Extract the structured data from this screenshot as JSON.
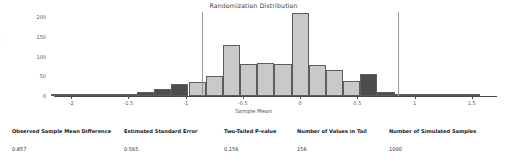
{
  "chart_data": {
    "type": "bar",
    "title": "Randomization Distribution",
    "xlabel": "Sample Mean",
    "ylabel": "Frequency",
    "xlim": [
      -2.15,
      1.72
    ],
    "ylim": [
      0,
      215
    ],
    "grid": false,
    "legend": "none",
    "bin_width": 0.15,
    "categories": [
      "-2.10",
      "-1.95",
      "-1.80",
      "-1.65",
      "-1.50",
      "-1.35",
      "-1.20",
      "-1.05",
      "-0.90",
      "-0.75",
      "-0.60",
      "-0.45",
      "-0.30",
      "-0.15",
      "0.00",
      "0.15",
      "0.30",
      "0.45",
      "0.60",
      "0.75",
      "0.90",
      "1.05",
      "1.20",
      "1.35",
      "1.50"
    ],
    "values": [
      2,
      2,
      3,
      4,
      6,
      10,
      18,
      30,
      35,
      50,
      130,
      80,
      84,
      80,
      210,
      78,
      67,
      38,
      55,
      10,
      5,
      3,
      2,
      1,
      1
    ],
    "bar_colors": [
      "dark",
      "dark",
      "dark",
      "dark",
      "dark",
      "dark",
      "dark",
      "dark",
      "light",
      "light",
      "light",
      "light",
      "light",
      "light",
      "light",
      "light",
      "light",
      "light",
      "dark",
      "dark",
      "dark",
      "dark",
      "dark",
      "dark",
      "dark"
    ],
    "xticks": [
      "-2",
      "-1.5",
      "-1",
      "-0.5",
      "0",
      "0.5",
      "1",
      "1.5"
    ],
    "xtick_values": [
      -2,
      -1.5,
      -1,
      -0.5,
      0,
      0.5,
      1,
      1.5
    ],
    "yticks": [
      "0",
      "50",
      "100",
      "150",
      "200"
    ],
    "ytick_values": [
      0,
      50,
      100,
      150,
      200
    ],
    "reference_lines": [
      -0.857,
      0.857
    ],
    "colors": {
      "bar_light": "#c9c9c9",
      "bar_dark": "#4d4d4d",
      "bar_edge": "#5d5d5d",
      "reference_line": "#9a9a9a",
      "axis": "#4a4a4a"
    }
  },
  "summary": {
    "columns": [
      {
        "header": "Observed Sample Mean Difference",
        "value": "0.857",
        "left": 12
      },
      {
        "header": "Estimated Standard Error",
        "value": "0.565",
        "left": 124
      },
      {
        "header": "Two-Tailed P-value",
        "value": "0.156",
        "left": 224
      },
      {
        "header": "Number of Values in Tail",
        "value": "156",
        "left": 297
      },
      {
        "header": "Number of Simulated Samples",
        "value": "1000",
        "left": 389
      }
    ]
  }
}
